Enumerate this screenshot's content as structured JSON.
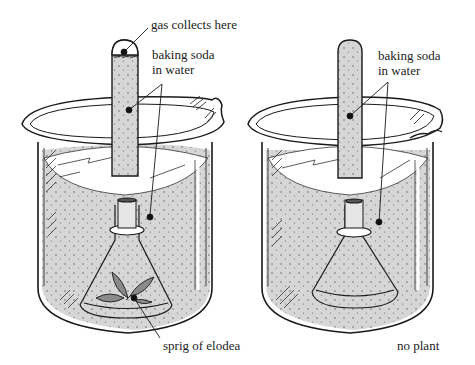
{
  "diagram": {
    "colors": {
      "liquid": "#d4d4d4",
      "outline": "#1a1a1a",
      "glass": "#ffffff",
      "leaf": "#8a8a8a",
      "text": "#222222"
    },
    "left_setup": {
      "labels": {
        "gas": "gas collects here",
        "solution_line1": "baking soda",
        "solution_line2": "in water",
        "plant": "sprig of elodea"
      }
    },
    "right_setup": {
      "labels": {
        "solution_line1": "baking soda",
        "solution_line2": "in water",
        "control": "no plant"
      }
    }
  }
}
